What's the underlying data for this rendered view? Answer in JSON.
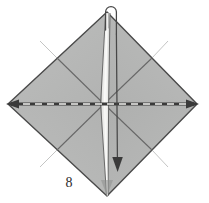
{
  "figure": {
    "step_label": "8"
  },
  "colors": {
    "background": "#ffffff",
    "paper_fill": "#b6b7b6",
    "paper_fill_light": "#c6c7c6",
    "paper_fill_dark": "#a9aaa9",
    "pleat_fill": "#efefee",
    "edge_stroke": "#4a4a4a",
    "crease_stroke": "#6e6e6e",
    "fold_line": "#3a3a3a",
    "fold_dash_light": "#f2f2f0",
    "arrow_stroke": "#3a3a3a",
    "label_text": "#2b2b2b"
  },
  "geometry": {
    "canvas": {
      "width": 209,
      "height": 203
    },
    "diamond": {
      "top": [
        107,
        12
      ],
      "right": [
        197,
        104
      ],
      "bottom": [
        107,
        196
      ],
      "left": [
        8,
        104
      ]
    },
    "center": [
      104,
      104
    ],
    "pleat": {
      "top_width": 5,
      "center_width": 7,
      "bottom_width": 3
    }
  },
  "annotations": {
    "horizontal_fold": {
      "name": "valley-fold-dashed-line",
      "style": "dashed",
      "from": [
        10,
        104
      ],
      "to": [
        195,
        104
      ],
      "arrowheads": "both"
    },
    "top_loop_arrow": {
      "name": "loop-arrow-over-top-corner",
      "direction": "over-and-down"
    },
    "bottom_arrow": {
      "name": "down-arrow",
      "direction": "down"
    }
  },
  "legend": {
    "dashed_line_meaning": "valley fold",
    "arrow_meaning": "fold direction"
  }
}
